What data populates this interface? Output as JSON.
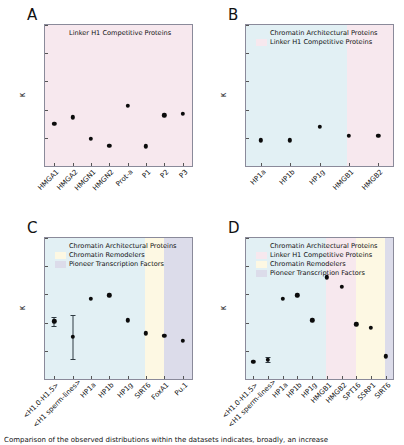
{
  "figure": {
    "caption": "Comparison of the observed distributions within the datasets indicates, broadly, an increase",
    "ylabel": "κ",
    "yticks": [
      "0.0",
      "0.2",
      "0.4",
      "0.6",
      "0.8",
      "1.0"
    ]
  },
  "colors": {
    "architectural": "#e2f0f4",
    "linker_competitive": "#f7e8ee",
    "remodelers": "#fdf8e3",
    "pioneer": "#dcdcea",
    "dot": "#0b0b0b",
    "errorbar": "#2f3b42",
    "axis": "#8a8a9a"
  },
  "legend_labels": {
    "architectural": "Chromatin Architectural Proteins",
    "linker_competitive": "Linker H1 Competitive Proteins",
    "remodelers": "Chromatin Remodelers",
    "pioneer": "Pioneer Transcription Factors"
  },
  "chart_data": [
    {
      "panel": "A",
      "type": "scatter",
      "title": "A",
      "xlabel": "",
      "ylabel": "κ",
      "ylim": [
        0.0,
        1.0
      ],
      "grid": false,
      "legend_position": "upper-left",
      "legend": [
        "Linker H1 Competitive Proteins"
      ],
      "bands": [
        {
          "label": "Linker H1 Competitive Proteins",
          "color": "#f7e8ee",
          "start": 0,
          "end": 8
        }
      ],
      "categories": [
        "HMGA1",
        "HMGA2",
        "HMGN1",
        "HMGN2",
        "Prot-a",
        "P1",
        "P2",
        "P3"
      ],
      "values": [
        0.3,
        0.345,
        0.195,
        0.145,
        0.425,
        0.14,
        0.36,
        0.37
      ],
      "errors": [
        null,
        null,
        null,
        null,
        null,
        null,
        null,
        null
      ]
    },
    {
      "panel": "B",
      "type": "scatter",
      "title": "B",
      "xlabel": "",
      "ylabel": "κ",
      "ylim": [
        0.0,
        1.0
      ],
      "grid": false,
      "legend_position": "upper-left",
      "legend": [
        "Chromatin Architectural Proteins",
        "Linker H1 Competitive Proteins"
      ],
      "bands": [
        {
          "label": "Chromatin Architectural Proteins",
          "color": "#e2f0f4",
          "start": 0,
          "end": 3.45
        },
        {
          "label": "Linker H1 Competitive Proteins",
          "color": "#f7e8ee",
          "start": 3.45,
          "end": 5
        }
      ],
      "categories": [
        "HP1a",
        "HP1b",
        "HP1g",
        "HMGB1",
        "HMGB2"
      ],
      "values": [
        0.182,
        0.183,
        0.278,
        0.212,
        0.216
      ],
      "errors": [
        null,
        null,
        null,
        null,
        null
      ]
    },
    {
      "panel": "C",
      "type": "scatter",
      "title": "C",
      "xlabel": "",
      "ylabel": "κ",
      "ylim": [
        0.0,
        1.0
      ],
      "grid": false,
      "legend_position": "upper-left",
      "legend": [
        "Chromatin Architectural Proteins",
        "Chromatin Remodelers",
        "Pioneer Transcription Factors"
      ],
      "bands": [
        {
          "label": "Chromatin Architectural Proteins",
          "color": "#e2f0f4",
          "start": 0,
          "end": 5.45
        },
        {
          "label": "Chromatin Remodelers",
          "color": "#fdf8e3",
          "start": 5.45,
          "end": 6.45
        },
        {
          "label": "Pioneer Transcription Factors",
          "color": "#dcdcea",
          "start": 6.45,
          "end": 8
        }
      ],
      "categories": [
        "<H1.0-H1.5>",
        "<H1 sperm-lines>",
        "HP1a",
        "HP1b",
        "HP1g",
        "SIRT6",
        "FoxA1",
        "Pu.1"
      ],
      "values": [
        0.41,
        0.3,
        0.57,
        0.593,
        0.415,
        0.323,
        0.307,
        0.273
      ],
      "errors": [
        {
          "low": 0.375,
          "high": 0.443
        },
        {
          "low": 0.143,
          "high": 0.452
        },
        null,
        null,
        null,
        null,
        null,
        null
      ]
    },
    {
      "panel": "D",
      "type": "scatter",
      "title": "D",
      "xlabel": "",
      "ylabel": "κ",
      "ylim": [
        0.0,
        1.0
      ],
      "grid": false,
      "legend_position": "upper-left",
      "legend": [
        "Chromatin Architectural Proteins",
        "Linker H1 Competitive Proteins",
        "Chromatin Remodelers",
        "Pioneer Transcription Factors"
      ],
      "bands": [
        {
          "label": "Chromatin Architectural Proteins",
          "color": "#e2f0f4",
          "start": 0,
          "end": 5.45
        },
        {
          "label": "Linker H1 Competitive Proteins",
          "color": "#f7e8ee",
          "start": 5.45,
          "end": 7.45
        },
        {
          "label": "Chromatin Remodelers",
          "color": "#fdf8e3",
          "start": 7.45,
          "end": 9.45
        },
        {
          "label": "Pioneer Transcription Factors",
          "color": "#dcdcea",
          "start": 9.45,
          "end": 10
        }
      ],
      "categories": [
        "<H1.0-H1.5>",
        "<H1 sperm-lines>",
        "HP1a",
        "HP1b",
        "HP1g",
        "HMGB1",
        "HMGB2",
        "SPT16",
        "SSRP1",
        "SIRT6"
      ],
      "values": [
        0.122,
        0.136,
        0.57,
        0.593,
        0.415,
        0.722,
        0.655,
        0.388,
        0.362,
        0.162
      ],
      "errors": [
        null,
        {
          "low": 0.118,
          "high": 0.158
        },
        null,
        null,
        null,
        null,
        null,
        null,
        null,
        null
      ]
    }
  ]
}
